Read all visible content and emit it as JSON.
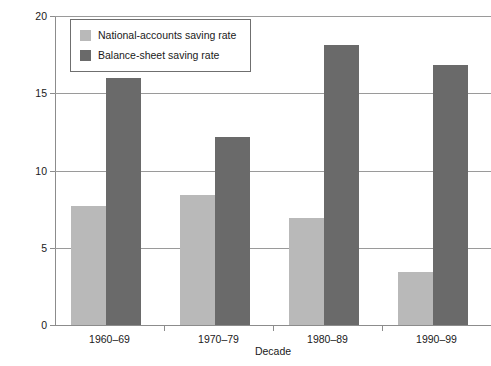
{
  "chart_data": {
    "type": "bar",
    "title": "",
    "xlabel": "Decade",
    "ylabel": "Saving rate (percent of income)",
    "categories": [
      "1960–69",
      "1970–79",
      "1980–89",
      "1990–99"
    ],
    "series": [
      {
        "name": "National-accounts saving rate",
        "color": "#b9b9b9",
        "values": [
          7.7,
          8.4,
          6.9,
          3.4
        ]
      },
      {
        "name": "Balance-sheet saving rate",
        "color": "#6a6a6a",
        "values": [
          16.0,
          12.2,
          18.1,
          16.8
        ]
      }
    ],
    "ylim": [
      0,
      20
    ],
    "yticks": [
      0,
      5,
      10,
      15,
      20
    ],
    "ytick_labels": [
      "0",
      "5",
      "10",
      "15",
      "20"
    ],
    "grid": true,
    "legend_position": "top-left"
  },
  "legend": {
    "items": [
      {
        "label": "National-accounts saving rate",
        "swatch": "light"
      },
      {
        "label": "Balance-sheet saving rate",
        "swatch": "dark"
      }
    ]
  }
}
